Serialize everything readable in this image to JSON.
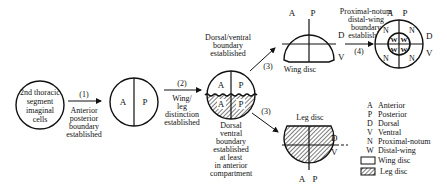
{
  "diagram": {
    "stage1": {
      "label_lines": [
        "2nd thoracic",
        "segment",
        "imaginal",
        "cells"
      ]
    },
    "step1": {
      "number": "(1)",
      "caption_lines": [
        "Anterior",
        "posterior",
        "boundary",
        "established"
      ]
    },
    "stage2": {
      "left": "A",
      "right": "P"
    },
    "step2": {
      "number": "(2)",
      "caption_lines": [
        "Wing/",
        "leg",
        "distinction",
        "established"
      ]
    },
    "stage3": {
      "upper_left": "A",
      "upper_right": "P",
      "lower_left": "A",
      "lower_right": "P",
      "caption_lines": [
        "Dorsal",
        "ventral",
        "boundary",
        "established",
        "at least",
        "in anterior",
        "compartment"
      ]
    },
    "step3_wing": {
      "number": "(3)",
      "caption_lines": [
        "Dorsal/ventral",
        "boundary",
        "established"
      ]
    },
    "wing_disc": {
      "title": "Wing disc",
      "a": "A",
      "p": "P",
      "d": "D",
      "v": "V"
    },
    "step4": {
      "number": "(4)",
      "caption_lines": [
        "Proximal-notum",
        "distal-wing",
        "boundary",
        "established"
      ]
    },
    "wing_final": {
      "a": "A",
      "p": "P",
      "d": "D",
      "v": "V",
      "n": "N",
      "w": "W"
    },
    "step3_leg": {
      "number": "(3)"
    },
    "leg_disc": {
      "title": "Leg disc",
      "a": "A",
      "p": "P",
      "d": "D",
      "v": "V"
    }
  },
  "legend": {
    "items": [
      {
        "key": "A",
        "label": "Anterior"
      },
      {
        "key": "P",
        "label": "Posterior"
      },
      {
        "key": "D",
        "label": "Dorsal"
      },
      {
        "key": "V",
        "label": "Ventral"
      },
      {
        "key": "N",
        "label": "Proximal-notum"
      },
      {
        "key": "W",
        "label": "Distal-wing"
      },
      {
        "key": "wing-swatch",
        "label": "Wing disc"
      },
      {
        "key": "leg-swatch",
        "label": "Leg disc"
      }
    ]
  }
}
